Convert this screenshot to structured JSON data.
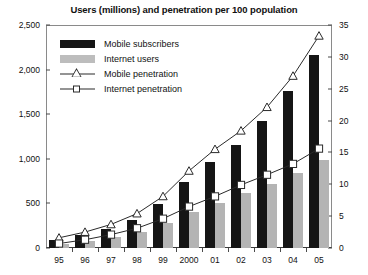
{
  "chart_data": {
    "type": "bar",
    "title": "Users (millions) and penetration per 100 population",
    "xlabel": "",
    "ylabel": "",
    "categories": [
      "95",
      "96",
      "97",
      "98",
      "99",
      "2000",
      "01",
      "02",
      "03",
      "04",
      "05"
    ],
    "ylim": [
      0,
      2500
    ],
    "y2lim": [
      0,
      35
    ],
    "yticks": [
      "0",
      "500",
      "1,000",
      "1,500",
      "2,000",
      "2,500"
    ],
    "ytick_values": [
      0,
      500,
      1000,
      1500,
      2000,
      2500
    ],
    "y2ticks": [
      "0",
      "5",
      "10",
      "15",
      "20",
      "25",
      "30",
      "35"
    ],
    "y2tick_values": [
      0,
      5,
      10,
      15,
      20,
      25,
      30,
      35
    ],
    "grid": false,
    "legend_position": "upper-left-inside",
    "series": [
      {
        "name": "Mobile subscribers",
        "kind": "bar",
        "axis": "left",
        "color": "#151515",
        "values": [
          91,
          145,
          215,
          318,
          490,
          740,
          960,
          1160,
          1420,
          1760,
          2160
        ]
      },
      {
        "name": "Internet users",
        "kind": "bar",
        "axis": "left",
        "color": "#b4b4b4",
        "values": [
          40,
          75,
          120,
          185,
          280,
          400,
          500,
          620,
          720,
          840,
          990
        ]
      },
      {
        "name": "Mobile penetration",
        "kind": "line",
        "axis": "right",
        "marker": "triangle",
        "color": "#2a2a2a",
        "values": [
          1.6,
          2.5,
          3.7,
          5.4,
          8.1,
          12.1,
          15.5,
          18.4,
          22.1,
          27.0,
          33.3
        ]
      },
      {
        "name": "Internet penetration",
        "kind": "line",
        "axis": "right",
        "marker": "square",
        "color": "#2a2a2a",
        "values": [
          0.7,
          1.3,
          2.1,
          3.1,
          4.6,
          6.5,
          8.1,
          9.9,
          11.5,
          13.2,
          15.6
        ]
      }
    ]
  },
  "legend": {
    "items": [
      {
        "label": "Mobile subscribers",
        "type": "swatch-black"
      },
      {
        "label": "Internet users",
        "type": "swatch-gray"
      },
      {
        "label": "Mobile penetration",
        "type": "line-triangle"
      },
      {
        "label": "Internet penetration",
        "type": "line-square"
      }
    ]
  }
}
